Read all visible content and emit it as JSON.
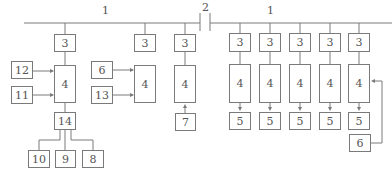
{
  "diagram": {
    "bus_labels": {
      "left": "1",
      "right": "1",
      "breaker": "2"
    },
    "nodes": [
      {
        "id": "l3a",
        "label": "3",
        "x": 54,
        "y": 34,
        "w": 22,
        "h": 18
      },
      {
        "id": "l4a",
        "label": "4",
        "x": 54,
        "y": 65,
        "w": 22,
        "h": 38
      },
      {
        "id": "n12",
        "label": "12",
        "x": 11,
        "y": 61,
        "w": 22,
        "h": 18
      },
      {
        "id": "n11",
        "label": "11",
        "x": 11,
        "y": 86,
        "w": 22,
        "h": 18
      },
      {
        "id": "n14",
        "label": "14",
        "x": 54,
        "y": 112,
        "w": 22,
        "h": 18
      },
      {
        "id": "n10",
        "label": "10",
        "x": 28,
        "y": 150,
        "w": 22,
        "h": 18
      },
      {
        "id": "n9",
        "label": "9",
        "x": 55,
        "y": 150,
        "w": 21,
        "h": 18
      },
      {
        "id": "n8",
        "label": "8",
        "x": 82,
        "y": 150,
        "w": 22,
        "h": 18
      },
      {
        "id": "l3b",
        "label": "3",
        "x": 134,
        "y": 34,
        "w": 22,
        "h": 18
      },
      {
        "id": "n6a",
        "label": "6",
        "x": 91,
        "y": 61,
        "w": 22,
        "h": 18
      },
      {
        "id": "n13",
        "label": "13",
        "x": 91,
        "y": 86,
        "w": 22,
        "h": 18
      },
      {
        "id": "l4b",
        "label": "4",
        "x": 134,
        "y": 65,
        "w": 22,
        "h": 38
      },
      {
        "id": "l3c",
        "label": "3",
        "x": 174,
        "y": 34,
        "w": 22,
        "h": 18
      },
      {
        "id": "l4c",
        "label": "4",
        "x": 174,
        "y": 65,
        "w": 22,
        "h": 38
      },
      {
        "id": "n7",
        "label": "7",
        "x": 175,
        "y": 113,
        "w": 21,
        "h": 18
      },
      {
        "id": "r3a",
        "label": "3",
        "x": 229,
        "y": 33,
        "w": 22,
        "h": 19
      },
      {
        "id": "r4a",
        "label": "4",
        "x": 229,
        "y": 64,
        "w": 22,
        "h": 39
      },
      {
        "id": "r5a",
        "label": "5",
        "x": 229,
        "y": 112,
        "w": 22,
        "h": 18
      },
      {
        "id": "r3b",
        "label": "3",
        "x": 259,
        "y": 33,
        "w": 22,
        "h": 19
      },
      {
        "id": "r4b",
        "label": "4",
        "x": 259,
        "y": 64,
        "w": 22,
        "h": 39
      },
      {
        "id": "r5b",
        "label": "5",
        "x": 259,
        "y": 112,
        "w": 22,
        "h": 18
      },
      {
        "id": "r3c",
        "label": "3",
        "x": 289,
        "y": 33,
        "w": 22,
        "h": 19
      },
      {
        "id": "r4c",
        "label": "4",
        "x": 289,
        "y": 64,
        "w": 22,
        "h": 39
      },
      {
        "id": "r5c",
        "label": "5",
        "x": 289,
        "y": 112,
        "w": 22,
        "h": 18
      },
      {
        "id": "r3d",
        "label": "3",
        "x": 319,
        "y": 33,
        "w": 22,
        "h": 19
      },
      {
        "id": "r4d",
        "label": "4",
        "x": 319,
        "y": 64,
        "w": 22,
        "h": 39
      },
      {
        "id": "r5d",
        "label": "5",
        "x": 319,
        "y": 112,
        "w": 22,
        "h": 18
      },
      {
        "id": "r3e",
        "label": "3",
        "x": 348,
        "y": 33,
        "w": 22,
        "h": 19
      },
      {
        "id": "r4e",
        "label": "4",
        "x": 348,
        "y": 64,
        "w": 22,
        "h": 39
      },
      {
        "id": "r5e",
        "label": "5",
        "x": 348,
        "y": 112,
        "w": 22,
        "h": 18
      },
      {
        "id": "n6b",
        "label": "6",
        "x": 349,
        "y": 134,
        "w": 22,
        "h": 18
      }
    ],
    "colors": {
      "line": "#7a7a7a",
      "text": "#555555"
    }
  }
}
